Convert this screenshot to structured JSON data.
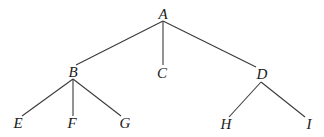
{
  "diagram": {
    "type": "tree",
    "line_color": "#3a3a3a",
    "text_color": "#1a1a1a",
    "nodes": [
      {
        "id": "A",
        "label": "A",
        "x": 163,
        "y": 14
      },
      {
        "id": "B",
        "label": "B",
        "x": 73,
        "y": 72
      },
      {
        "id": "C",
        "label": "C",
        "x": 162,
        "y": 73
      },
      {
        "id": "D",
        "label": "D",
        "x": 262,
        "y": 74
      },
      {
        "id": "E",
        "label": "E",
        "x": 18,
        "y": 123
      },
      {
        "id": "F",
        "label": "F",
        "x": 72,
        "y": 123
      },
      {
        "id": "G",
        "label": "G",
        "x": 125,
        "y": 123
      },
      {
        "id": "H",
        "label": "H",
        "x": 226,
        "y": 124
      },
      {
        "id": "I",
        "label": "I",
        "x": 309,
        "y": 124
      }
    ],
    "edges": [
      {
        "from": "A",
        "to": "B",
        "x1": 163,
        "y1": 21,
        "x2": 76,
        "y2": 65
      },
      {
        "from": "A",
        "to": "C",
        "x1": 163,
        "y1": 21,
        "x2": 163,
        "y2": 65
      },
      {
        "from": "A",
        "to": "D",
        "x1": 163,
        "y1": 21,
        "x2": 256,
        "y2": 67
      },
      {
        "from": "B",
        "to": "E",
        "x1": 73,
        "y1": 79,
        "x2": 22,
        "y2": 116
      },
      {
        "from": "B",
        "to": "F",
        "x1": 73,
        "y1": 79,
        "x2": 73,
        "y2": 116
      },
      {
        "from": "B",
        "to": "G",
        "x1": 73,
        "y1": 79,
        "x2": 121,
        "y2": 116
      },
      {
        "from": "D",
        "to": "H",
        "x1": 261,
        "y1": 82,
        "x2": 229,
        "y2": 117
      },
      {
        "from": "D",
        "to": "I",
        "x1": 261,
        "y1": 82,
        "x2": 305,
        "y2": 117
      }
    ]
  }
}
